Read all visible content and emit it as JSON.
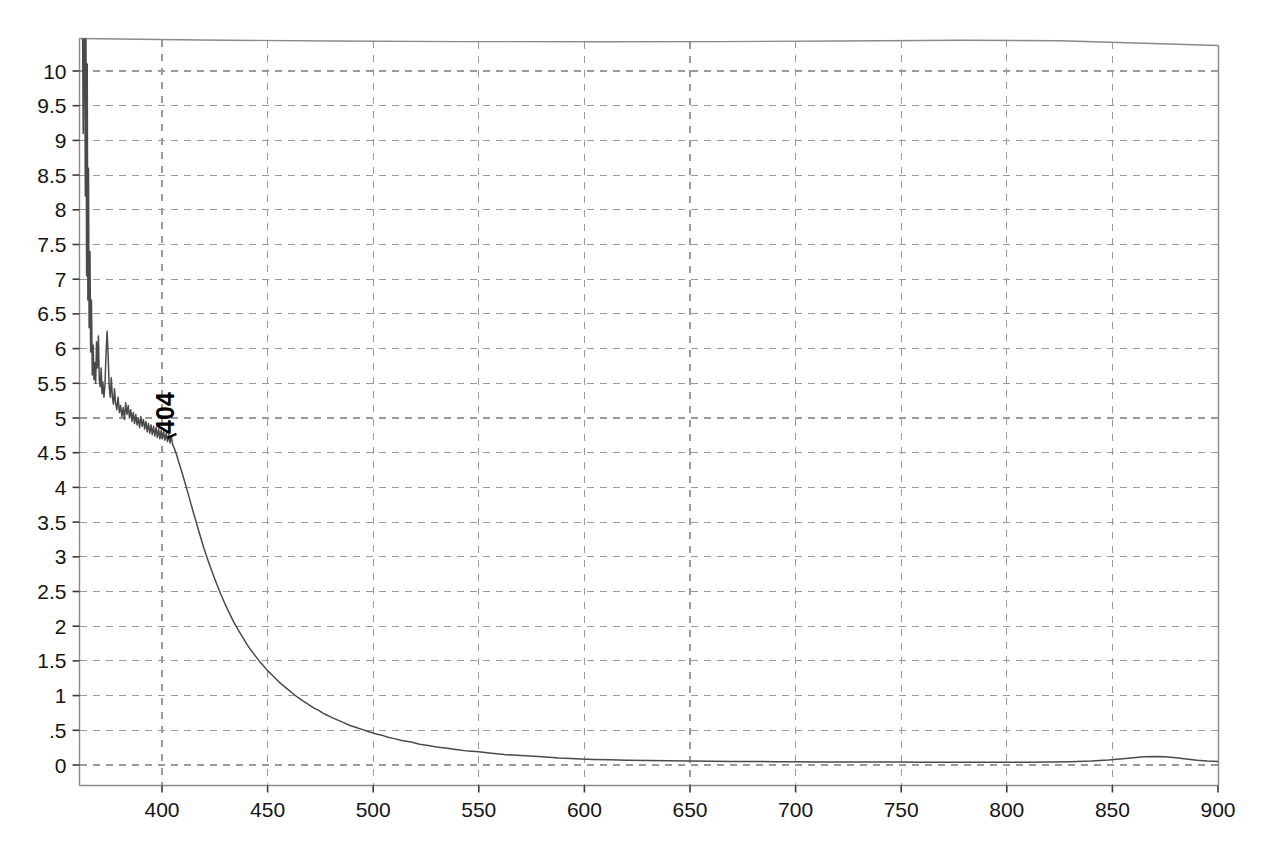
{
  "chart_data": {
    "type": "line",
    "title": "",
    "subtitle": "",
    "xlabel": "",
    "ylabel": "",
    "xlim": [
      362,
      900
    ],
    "ylim": [
      0,
      10.55
    ],
    "grid": true,
    "legend": null,
    "legend_position": "none",
    "x_ticks": [
      400,
      450,
      500,
      550,
      600,
      650,
      700,
      750,
      800,
      850,
      900
    ],
    "x_tick_labels": [
      "400",
      "450",
      "500",
      "550",
      "600",
      "650",
      "700",
      "750",
      "800",
      "850",
      "900"
    ],
    "y_ticks": [
      0,
      0.5,
      1,
      1.5,
      2,
      2.5,
      3,
      3.5,
      4,
      4.5,
      5,
      5.5,
      6,
      6.5,
      7,
      7.5,
      8,
      8.5,
      9,
      9.5,
      10
    ],
    "y_tick_labels": [
      "0",
      ".5",
      "1",
      "1.5",
      "2",
      "2.5",
      "3",
      "3.5",
      "4",
      "4.5",
      "5",
      "5.5",
      "6",
      "6.5",
      "7",
      "7.5",
      "8",
      "8.5",
      "9",
      "9.5",
      "10"
    ],
    "annotations": [
      {
        "text": "404",
        "x": 404,
        "y": 4.8,
        "rotation": -90
      }
    ],
    "series": [
      {
        "name": "absorbance",
        "color": "#4a4a4a",
        "points": [
          [
            362.0,
            10.55
          ],
          [
            362.4,
            10.55
          ],
          [
            362.7,
            9.1
          ],
          [
            363.0,
            10.55
          ],
          [
            363.4,
            10.55
          ],
          [
            363.7,
            8.2
          ],
          [
            364.0,
            10.55
          ],
          [
            364.3,
            7.05
          ],
          [
            364.6,
            10.1
          ],
          [
            364.9,
            6.7
          ],
          [
            365.2,
            8.6
          ],
          [
            365.5,
            6.3
          ],
          [
            365.9,
            7.4
          ],
          [
            366.2,
            5.95
          ],
          [
            366.6,
            6.7
          ],
          [
            367.0,
            5.62
          ],
          [
            367.4,
            6.05
          ],
          [
            367.8,
            5.55
          ],
          [
            368.2,
            5.8
          ],
          [
            368.6,
            5.5
          ],
          [
            369.0,
            6.1
          ],
          [
            369.4,
            5.72
          ],
          [
            369.9,
            6.18
          ],
          [
            370.3,
            5.55
          ],
          [
            370.8,
            5.45
          ],
          [
            371.2,
            5.72
          ],
          [
            371.6,
            5.35
          ],
          [
            372.0,
            5.52
          ],
          [
            372.5,
            5.3
          ],
          [
            373.0,
            5.48
          ],
          [
            373.5,
            5.92
          ],
          [
            374.0,
            6.25
          ],
          [
            374.5,
            5.9
          ],
          [
            375.0,
            5.45
          ],
          [
            375.5,
            5.3
          ],
          [
            376.0,
            5.58
          ],
          [
            376.5,
            5.3
          ],
          [
            377.0,
            5.2
          ],
          [
            377.5,
            5.42
          ],
          [
            378.0,
            5.22
          ],
          [
            378.6,
            5.12
          ],
          [
            379.2,
            5.3
          ],
          [
            379.8,
            5.08
          ],
          [
            380.4,
            5.18
          ],
          [
            381.0,
            5.02
          ],
          [
            381.6,
            5.15
          ],
          [
            382.2,
            4.98
          ],
          [
            382.8,
            5.22
          ],
          [
            383.4,
            5.05
          ],
          [
            384.0,
            5.18
          ],
          [
            384.6,
            5.0
          ],
          [
            385.2,
            5.12
          ],
          [
            385.8,
            4.95
          ],
          [
            386.4,
            5.08
          ],
          [
            387.0,
            4.92
          ],
          [
            387.6,
            5.05
          ],
          [
            388.2,
            4.9
          ],
          [
            388.8,
            5.0
          ],
          [
            389.4,
            4.86
          ],
          [
            390.0,
            5.02
          ],
          [
            390.6,
            4.88
          ],
          [
            391.2,
            4.98
          ],
          [
            391.8,
            4.84
          ],
          [
            392.4,
            4.95
          ],
          [
            393.0,
            4.8
          ],
          [
            393.6,
            4.92
          ],
          [
            394.2,
            4.78
          ],
          [
            394.8,
            4.9
          ],
          [
            395.4,
            4.76
          ],
          [
            396.0,
            4.88
          ],
          [
            396.6,
            4.74
          ],
          [
            397.2,
            4.86
          ],
          [
            397.8,
            4.72
          ],
          [
            398.4,
            4.84
          ],
          [
            399.0,
            4.7
          ],
          [
            399.6,
            4.82
          ],
          [
            400.2,
            4.7
          ],
          [
            400.8,
            4.8
          ],
          [
            401.4,
            4.68
          ],
          [
            402.0,
            4.78
          ],
          [
            402.6,
            4.66
          ],
          [
            403.2,
            4.76
          ],
          [
            403.8,
            4.64
          ],
          [
            404.4,
            4.74
          ],
          [
            405.0,
            4.62
          ],
          [
            406.0,
            4.55
          ],
          [
            407.0,
            4.46
          ],
          [
            408.0,
            4.36
          ],
          [
            410.0,
            4.16
          ],
          [
            412.0,
            3.95
          ],
          [
            414.0,
            3.73
          ],
          [
            416.0,
            3.52
          ],
          [
            418.0,
            3.31
          ],
          [
            420.0,
            3.11
          ],
          [
            422.0,
            2.93
          ],
          [
            424.0,
            2.76
          ],
          [
            426.0,
            2.6
          ],
          [
            428.0,
            2.45
          ],
          [
            430.0,
            2.31
          ],
          [
            432.0,
            2.18
          ],
          [
            434.0,
            2.06
          ],
          [
            436.0,
            1.95
          ],
          [
            438.0,
            1.85
          ],
          [
            440.0,
            1.75
          ],
          [
            442.0,
            1.66
          ],
          [
            444.0,
            1.58
          ],
          [
            446.0,
            1.5
          ],
          [
            448.0,
            1.43
          ],
          [
            450.0,
            1.36
          ],
          [
            452.0,
            1.3
          ],
          [
            454.0,
            1.24
          ],
          [
            456.0,
            1.18
          ],
          [
            458.0,
            1.13
          ],
          [
            460.0,
            1.08
          ],
          [
            462.0,
            1.03
          ],
          [
            464.0,
            0.98
          ],
          [
            466.0,
            0.94
          ],
          [
            468.0,
            0.9
          ],
          [
            470.0,
            0.86
          ],
          [
            472.0,
            0.82
          ],
          [
            474.0,
            0.79
          ],
          [
            476.0,
            0.75
          ],
          [
            478.0,
            0.72
          ],
          [
            480.0,
            0.69
          ],
          [
            483.0,
            0.65
          ],
          [
            486.0,
            0.61
          ],
          [
            489.0,
            0.57
          ],
          [
            492.0,
            0.54
          ],
          [
            495.0,
            0.51
          ],
          [
            498.0,
            0.48
          ],
          [
            501.0,
            0.45
          ],
          [
            504.0,
            0.43
          ],
          [
            507.0,
            0.4
          ],
          [
            510.0,
            0.38
          ],
          [
            514.0,
            0.35
          ],
          [
            518.0,
            0.33
          ],
          [
            522.0,
            0.3
          ],
          [
            526.0,
            0.28
          ],
          [
            530.0,
            0.26
          ],
          [
            535.0,
            0.24
          ],
          [
            540.0,
            0.22
          ],
          [
            545.0,
            0.2
          ],
          [
            550.0,
            0.19
          ],
          [
            556.0,
            0.17
          ],
          [
            562.0,
            0.15
          ],
          [
            568.0,
            0.14
          ],
          [
            574.0,
            0.13
          ],
          [
            580.0,
            0.12
          ],
          [
            588.0,
            0.1
          ],
          [
            596.0,
            0.09
          ],
          [
            604.0,
            0.08
          ],
          [
            612.0,
            0.075
          ],
          [
            620.0,
            0.07
          ],
          [
            630.0,
            0.065
          ],
          [
            640.0,
            0.06
          ],
          [
            650.0,
            0.058
          ],
          [
            660.0,
            0.055
          ],
          [
            670.0,
            0.052
          ],
          [
            680.0,
            0.05
          ],
          [
            690.0,
            0.048
          ],
          [
            700.0,
            0.046
          ],
          [
            710.0,
            0.045
          ],
          [
            720.0,
            0.044
          ],
          [
            730.0,
            0.043
          ],
          [
            740.0,
            0.042
          ],
          [
            750.0,
            0.042
          ],
          [
            760.0,
            0.041
          ],
          [
            770.0,
            0.041
          ],
          [
            780.0,
            0.04
          ],
          [
            790.0,
            0.04
          ],
          [
            800.0,
            0.04
          ],
          [
            810.0,
            0.041
          ],
          [
            820.0,
            0.043
          ],
          [
            830.0,
            0.048
          ],
          [
            840.0,
            0.058
          ],
          [
            848.0,
            0.072
          ],
          [
            855.0,
            0.09
          ],
          [
            860.0,
            0.105
          ],
          [
            865.0,
            0.118
          ],
          [
            870.0,
            0.124
          ],
          [
            875.0,
            0.12
          ],
          [
            880.0,
            0.105
          ],
          [
            885.0,
            0.085
          ],
          [
            890.0,
            0.068
          ],
          [
            895.0,
            0.056
          ],
          [
            900.0,
            0.05
          ]
        ]
      }
    ]
  },
  "axes": {
    "frame_color": "#8a8a8a",
    "grid_color": "#9a9a9a",
    "curve_color": "#4a4a4a",
    "tick_text_color": "#141414"
  }
}
